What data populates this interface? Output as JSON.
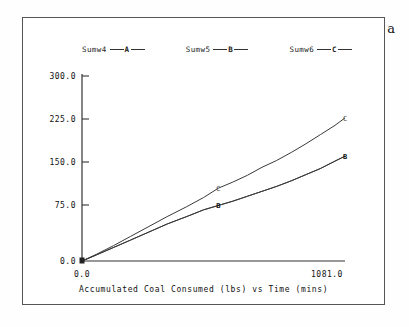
{
  "panel": {
    "label": "a"
  },
  "legend": {
    "entries": [
      {
        "name": "Sumw4",
        "key": "A"
      },
      {
        "name": "Sumw5",
        "key": "B"
      },
      {
        "name": "Sumw6",
        "key": "C"
      }
    ]
  },
  "axes": {
    "y_ticks": [
      "300.0",
      "225.0",
      "150.0",
      "75.0",
      "0.0"
    ],
    "x_ticks": [
      "0.0",
      "1081.0"
    ],
    "x_title": "Accumulated Coal Consumed (lbs) vs  Time (mins)"
  },
  "chart_data": {
    "type": "line",
    "title": "",
    "subtitle": "",
    "xlabel": "Accumulated Coal Consumed (lbs) vs  Time (mins)",
    "ylabel": "",
    "xlim": [
      0.0,
      1081.0
    ],
    "ylim": [
      0.0,
      300.0
    ],
    "xticks": [
      0.0,
      1081.0
    ],
    "yticks": [
      0.0,
      75.0,
      150.0,
      225.0,
      300.0
    ],
    "grid": false,
    "legend_position": "top",
    "annotations": [
      "a"
    ],
    "series": [
      {
        "name": "Sumw4",
        "key": "A",
        "marker_label": "A",
        "x": [
          0,
          60,
          130,
          200,
          275,
          350,
          430,
          500,
          560,
          620,
          680,
          740,
          800,
          860,
          920,
          980,
          1040,
          1081
        ],
        "y": [
          0,
          10,
          22,
          34,
          47,
          60,
          72,
          83,
          90,
          97,
          105,
          113,
          121,
          130,
          140,
          150,
          162,
          170
        ]
      },
      {
        "name": "Sumw5",
        "key": "B",
        "marker_label": "B",
        "x": [
          0,
          60,
          130,
          200,
          275,
          350,
          430,
          500,
          560,
          620,
          680,
          740,
          800,
          860,
          920,
          980,
          1040,
          1081
        ],
        "y": [
          0,
          10,
          22,
          34,
          47,
          60,
          72,
          83,
          90,
          97,
          105,
          113,
          121,
          130,
          140,
          150,
          162,
          170
        ]
      },
      {
        "name": "Sumw6",
        "key": "C",
        "marker_label": "C",
        "x": [
          0,
          60,
          130,
          200,
          275,
          350,
          430,
          500,
          560,
          620,
          680,
          740,
          800,
          860,
          920,
          980,
          1040,
          1081
        ],
        "y": [
          0,
          11,
          25,
          40,
          56,
          72,
          88,
          103,
          118,
          128,
          139,
          152,
          163,
          176,
          190,
          205,
          220,
          232
        ]
      }
    ],
    "markers": [
      {
        "label": "C",
        "x": 560,
        "y": 118
      },
      {
        "label": "B",
        "x": 560,
        "y": 90
      },
      {
        "label": "C",
        "x": 1081,
        "y": 232
      },
      {
        "label": "B",
        "x": 1081,
        "y": 170
      }
    ]
  }
}
